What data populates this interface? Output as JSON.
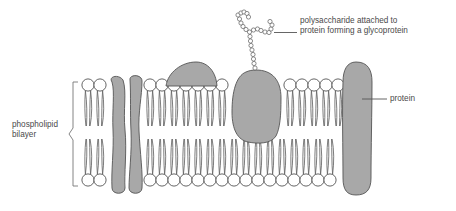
{
  "diagram": {
    "type": "biological-diagram"
  },
  "labels": {
    "polysaccharide": {
      "line1": "polysaccharide attached to",
      "line2": "protein forming a glycoprotein",
      "name": "polysaccharide-label"
    },
    "protein": {
      "text": "protein",
      "name": "protein-label"
    },
    "bilayer": {
      "line1": "phospholipid",
      "line2": "bilayer",
      "name": "phospholipid-bilayer-label"
    }
  },
  "colors": {
    "protein_fill": "#a8a8a8",
    "protein_stroke": "#555555",
    "head_fill": "#ffffff",
    "head_stroke": "#555555",
    "tail_stroke": "#666666",
    "text": "#4a4a4a",
    "leader_line": "#555555",
    "background": "#ffffff"
  },
  "structure": {
    "membrane": {
      "top_heads_y": 85,
      "bottom_heads_y": 180,
      "head_radius": 6.1,
      "head_spacing": 12.6,
      "left_edge": 82,
      "right_edge": 362,
      "midline_gap_y": 132
    },
    "top_leaflet_heads_x": [
      88,
      100,
      150,
      162,
      174,
      186,
      198,
      210,
      222,
      290,
      302,
      314,
      326,
      338
    ],
    "bottom_leaflet_heads_x": [
      88,
      100,
      150,
      162,
      174,
      186,
      198,
      210,
      222,
      234,
      246,
      258,
      270,
      282,
      294,
      306,
      318,
      330
    ],
    "proteins": [
      {
        "name": "transmembrane-protein-left-a",
        "kind": "transmembrane",
        "x": 112,
        "y": 76,
        "width": 14,
        "height": 118
      },
      {
        "name": "transmembrane-protein-left-b",
        "kind": "transmembrane",
        "x": 128,
        "y": 76,
        "width": 15,
        "height": 118
      },
      {
        "name": "peripheral-protein-dome",
        "kind": "peripheral-surface",
        "x": 166,
        "y": 62,
        "width": 50,
        "height": 24
      },
      {
        "name": "glycoprotein-blob",
        "kind": "transmembrane-glycoprotein",
        "x": 232,
        "y": 70,
        "width": 48,
        "height": 70
      },
      {
        "name": "transmembrane-protein-right",
        "kind": "transmembrane",
        "x": 342,
        "y": 62,
        "width": 30,
        "height": 133
      }
    ],
    "polysaccharide": {
      "name": "polysaccharide-chain",
      "bead_radius": 2.1,
      "branched": true,
      "branch_count": 2,
      "attachment_x": 255,
      "attachment_y": 70,
      "bead_count": 26
    },
    "bracket": {
      "name": "bilayer-bracket",
      "x": 72,
      "y_top": 82,
      "y_bottom": 186,
      "notch_y": 134
    }
  }
}
